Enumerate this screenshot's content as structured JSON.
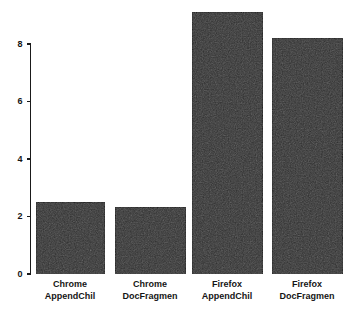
{
  "chart_data": {
    "type": "bar",
    "title": "",
    "subtitle": "",
    "xlabel": "",
    "ylabel": "",
    "categories": [
      "Chrome\nAppendChil",
      "Chrome\nDocFragmen",
      "Firefox\nAppendChil",
      "Firefox\nDocFragmen"
    ],
    "category_lines": [
      [
        "Chrome",
        "AppendChil"
      ],
      [
        "Chrome",
        "DocFragmen"
      ],
      [
        "Firefox",
        "AppendChil"
      ],
      [
        "Firefox",
        "DocFragmen"
      ]
    ],
    "values": [
      2.5,
      2.3,
      9.1,
      8.2
    ],
    "ylim": [
      0,
      9.6
    ],
    "yticks": [
      0,
      2,
      4,
      6,
      8
    ],
    "ytick_labels": [
      "0",
      "2",
      "4",
      "6",
      "8"
    ],
    "grid": false,
    "legend": false,
    "bar_color": "#2e2e2e",
    "bar_edge_color": "#0d0d0d",
    "axis_color": "#1a1a1a",
    "background_color": "#ffffff"
  }
}
